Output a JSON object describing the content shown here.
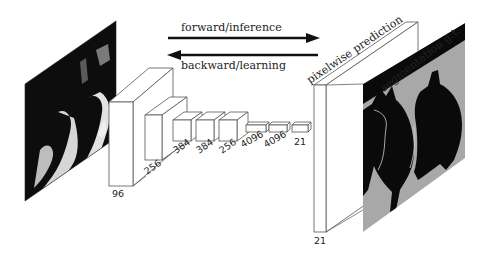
{
  "diagram": {
    "arrows": {
      "forward_label": "forward/inference",
      "backward_label": "backward/learning"
    },
    "input_image": {
      "description": "RGB input photo of two cats (grayscale)"
    },
    "layers": [
      {
        "label": "96"
      },
      {
        "label": "256"
      },
      {
        "label": "384"
      },
      {
        "label": "384"
      },
      {
        "label": "256"
      },
      {
        "label": "4096"
      },
      {
        "label": "4096"
      },
      {
        "label": "21"
      }
    ],
    "output": {
      "prediction_label": "pixelwise prediction",
      "prediction_channels": "21",
      "ground_truth_label": "segmentation g.t."
    },
    "colors": {
      "line": "#555555",
      "arrow": "#111111",
      "gt_background": "#a8a8a8",
      "gt_foreground": "#0a0a0a",
      "page": "#ffffff"
    }
  }
}
